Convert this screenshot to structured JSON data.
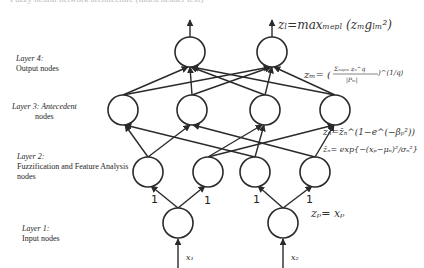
{
  "caption": "Fuzzy neural network architecture (faded header text)",
  "layers": [
    {
      "id": "layer4",
      "title": "Layer 4:",
      "subtitle": "Output nodes",
      "equation": "z_l = max_{m∈P_l} (z_m g_lm^2)"
    },
    {
      "id": "layer3",
      "title": "Layer 3:",
      "subtitle": "Antecedent nodes",
      "title_inline": "Layer 3: Antecedent",
      "subtitle_line2": "nodes",
      "equation": "z_m = ( Σ_{n∈P_m} z_n^q / |P_m| )^(1/q)"
    },
    {
      "id": "layer2",
      "title": "Layer 2:",
      "subtitle_line1": "Fuzzification and Feature Analysis",
      "subtitle_line2": "nodes",
      "equation_1": "z_n = z̄_n^(1−e^(−β_p^2))",
      "equation_2": "z̄_n = exp{ −(x_p − μ_n)^2 / σ_n^2 }"
    },
    {
      "id": "layer1",
      "title": "Layer 1:",
      "subtitle": "Input nodes",
      "equation": "z_p = x_p"
    }
  ],
  "labels": {
    "l4_title": "Layer 4:",
    "l4_sub": "Output nodes",
    "l3_title": "Layer 3: Antecedent",
    "l3_sub": "nodes",
    "l2_title": "Layer 2:",
    "l2_sub1": "Fuzzification and Feature Analysis",
    "l2_sub2": "nodes",
    "l1_title": "Layer 1:",
    "l1_sub": "Input nodes"
  },
  "equations": {
    "l4": "zₗ=maxₘₑₚₗ (zₘgₗₘ²)",
    "l3_lhs": "zₘ= (",
    "l3_num": "Σₙₑₚₘ zₙ^q",
    "l3_den": "|Pₘ|",
    "l3_exp": ")^(1/q)",
    "l2a": "zₙ=z̄ₙ^(1−e^(−βₚ²))",
    "l2b": "z̄ₙ= exp{−(xₚ−μₙ)²/σₙ²}",
    "l1": "zₚ= xₚ"
  },
  "edge_weights": [
    "1",
    "1",
    "1",
    "1"
  ],
  "inputs": [
    "x₁",
    "x₂"
  ],
  "colors": {
    "stroke": "#2a2a2a",
    "text": "#1e1e1e",
    "background": "#ffffff"
  }
}
